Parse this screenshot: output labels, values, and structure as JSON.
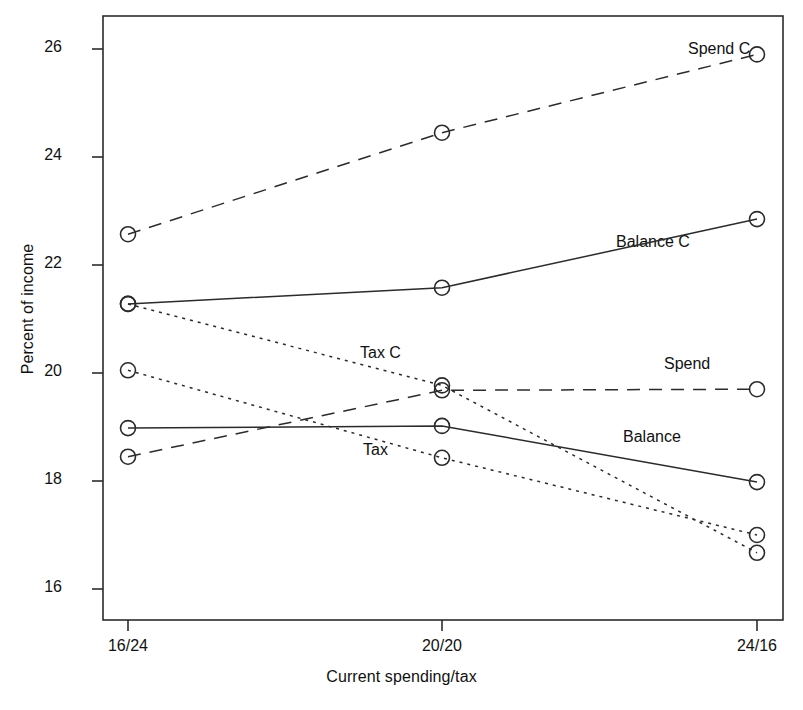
{
  "chart_data": {
    "type": "line",
    "title": "",
    "xlabel": "Current spending/tax",
    "ylabel": "Percent of income",
    "categories": [
      "16/24",
      "20/20",
      "24/16"
    ],
    "ylim": [
      15.4,
      26.6
    ],
    "yticks": [
      16,
      18,
      20,
      22,
      24,
      26
    ],
    "ytick_labels": [
      "16",
      "18",
      "20",
      "22",
      "24",
      "26"
    ],
    "grid": false,
    "legend": "inline-labels",
    "marker": "open-circle",
    "series": [
      {
        "name": "Spend C",
        "label": "Spend C",
        "linestyle": "dashed",
        "values": [
          22.57,
          24.45,
          25.9
        ],
        "label_x": 688,
        "label_y": 40
      },
      {
        "name": "Balance C",
        "label": "Balance C",
        "linestyle": "solid",
        "values": [
          21.28,
          21.58,
          22.85
        ],
        "label_x": 616,
        "label_y": 233
      },
      {
        "name": "Tax C",
        "label": "Tax C",
        "linestyle": "dotted",
        "values": [
          21.28,
          19.77,
          16.67
        ],
        "label_x": 360,
        "label_y": 344
      },
      {
        "name": "Spend",
        "label": "Spend",
        "linestyle": "dashed",
        "values": [
          18.45,
          19.68,
          19.7
        ],
        "label_x": 664,
        "label_y": 355
      },
      {
        "name": "Balance",
        "label": "Balance",
        "linestyle": "solid",
        "values": [
          18.98,
          19.02,
          17.98
        ],
        "label_x": 623,
        "label_y": 428
      },
      {
        "name": "Tax",
        "label": "Tax",
        "linestyle": "dotted",
        "values": [
          20.05,
          18.43,
          17.0
        ],
        "label_x": 363,
        "label_y": 441
      }
    ]
  },
  "axes": {
    "x_tick_labels": [
      "16/24",
      "20/20",
      "24/16"
    ],
    "y_tick_labels": [
      "26",
      "24",
      "22",
      "20",
      "18",
      "16"
    ],
    "x_axis_title": "Current spending/tax",
    "y_axis_title": "Percent of income"
  }
}
